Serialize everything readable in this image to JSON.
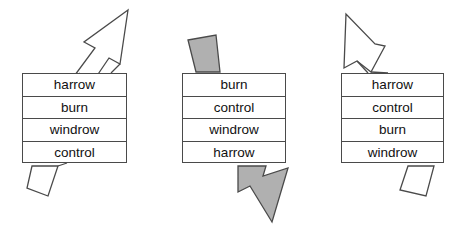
{
  "diagram": {
    "treatments": [
      "harrow",
      "burn",
      "windrow",
      "control"
    ],
    "colors": {
      "outline": "#4a4a4a",
      "arrow_fill_open": "#ffffff",
      "arrow_fill_shaded": "#b0b0b0",
      "text": "#111111",
      "background": "#ffffff"
    },
    "blocks": [
      {
        "id": "block-1",
        "label": "Block 1",
        "cells": [
          "harrow",
          "burn",
          "windrow",
          "control"
        ],
        "top_arrow": {
          "name": "arrow-up-right-open",
          "direction": "up-right",
          "style": "open",
          "fill": "#ffffff",
          "kind": "arrowhead"
        },
        "bottom_arrow": {
          "name": "arrow-tail-down-left-open",
          "direction": "down-left",
          "style": "open",
          "fill": "#ffffff",
          "kind": "tail"
        }
      },
      {
        "id": "block-2",
        "label": "Block 2",
        "cells": [
          "burn",
          "control",
          "windrow",
          "harrow"
        ],
        "top_arrow": {
          "name": "arrow-tail-down-right-shaded",
          "direction": "down-right",
          "style": "shaded",
          "fill": "#b0b0b0",
          "kind": "tail"
        },
        "bottom_arrow": {
          "name": "arrow-down-right-shaded",
          "direction": "down-right",
          "style": "shaded",
          "fill": "#b0b0b0",
          "kind": "arrowhead"
        }
      },
      {
        "id": "block-3",
        "label": "Block 3",
        "cells": [
          "harrow",
          "control",
          "burn",
          "windrow"
        ],
        "top_arrow": {
          "name": "arrow-up-left-open",
          "direction": "up-left",
          "style": "open",
          "fill": "#ffffff",
          "kind": "arrowhead"
        },
        "bottom_arrow": {
          "name": "arrow-tail-down-right-open",
          "direction": "down-right",
          "style": "open",
          "fill": "#ffffff",
          "kind": "tail"
        }
      }
    ]
  }
}
